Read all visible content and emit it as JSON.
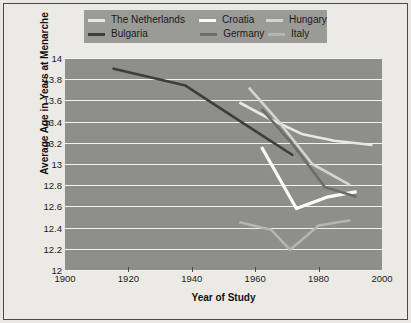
{
  "chart_data": {
    "type": "line",
    "title": "",
    "xlabel": "Year of Study",
    "ylabel": "Average Age in Years at Menarche",
    "xlim": [
      1900,
      2000
    ],
    "ylim": [
      12,
      14
    ],
    "grid": true,
    "legend_position": "top",
    "xticks": [
      1900,
      1920,
      1940,
      1960,
      1980,
      2000
    ],
    "xtick_labels": [
      "1900",
      "1920",
      "1940",
      "1960",
      "1980",
      "2000"
    ],
    "yticks": [
      12,
      12.2,
      12.4,
      12.6,
      12.8,
      13,
      13.2,
      13.4,
      13.6,
      13.8,
      14
    ],
    "ytick_labels": [
      "12",
      "12.2",
      "12.4",
      "12.6",
      "12.8",
      "13",
      "13.2",
      "13.4",
      "13.6",
      "13.8",
      "14"
    ],
    "series": [
      {
        "name": "The Netherlands",
        "color": "#e8e7e2",
        "width": 2.6,
        "x": [
          1955,
          1965,
          1975,
          1985,
          1997
        ],
        "y": [
          13.58,
          13.42,
          13.28,
          13.22,
          13.18
        ]
      },
      {
        "name": "Croatia",
        "color": "#fbfbf8",
        "width": 3.2,
        "x": [
          1962,
          1973,
          1983,
          1992
        ],
        "y": [
          13.16,
          12.58,
          12.69,
          12.74
        ]
      },
      {
        "name": "Hungary",
        "color": "#d5d4cf",
        "width": 2.6,
        "x": [
          1958,
          1968,
          1978,
          1990
        ],
        "y": [
          13.72,
          13.38,
          13.0,
          12.8
        ]
      },
      {
        "name": "Bulgaria",
        "color": "#3d3d3c",
        "width": 2.6,
        "x": [
          1915,
          1938,
          1958,
          1972
        ],
        "y": [
          13.9,
          13.74,
          13.35,
          13.08
        ]
      },
      {
        "name": "Germany",
        "color": "#6d6d69",
        "width": 2.6,
        "x": [
          1962,
          1972,
          1982,
          1992
        ],
        "y": [
          13.52,
          13.18,
          12.78,
          12.69
        ]
      },
      {
        "name": "Italy",
        "color": "#b6b5b0",
        "width": 2.6,
        "x": [
          1955,
          1965,
          1971,
          1980,
          1990
        ],
        "y": [
          12.45,
          12.38,
          12.19,
          12.42,
          12.47
        ]
      }
    ]
  },
  "legend": {
    "rows": [
      [
        {
          "label": "The Netherlands",
          "color": "#e8e7e2"
        },
        {
          "label": "Croatia",
          "color": "#fbfbf8"
        },
        {
          "label": "Hungary",
          "color": "#d5d4cf"
        }
      ],
      [
        {
          "label": "Bulgaria",
          "color": "#3d3d3c"
        },
        {
          "label": "Germany",
          "color": "#6d6d69"
        },
        {
          "label": "Italy",
          "color": "#b6b5b0"
        }
      ]
    ]
  }
}
